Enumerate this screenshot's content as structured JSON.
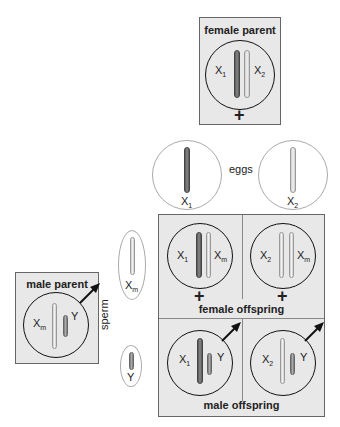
{
  "female_parent": {
    "title": "female parent",
    "chromosomes": [
      {
        "label": "X",
        "sub": "1"
      },
      {
        "label": "X",
        "sub": "2"
      }
    ],
    "symbol": "+"
  },
  "eggs": {
    "label": "eggs",
    "items": [
      {
        "label": "X",
        "sub": "1"
      },
      {
        "label": "X",
        "sub": "2"
      }
    ]
  },
  "male_parent": {
    "title": "male parent",
    "chromosomes": [
      {
        "label": "X",
        "sub": "m"
      },
      {
        "label": "Y",
        "sub": ""
      }
    ]
  },
  "sperm": {
    "label": "sperm",
    "items": [
      {
        "label": "X",
        "sub": "m"
      },
      {
        "label": "Y",
        "sub": ""
      }
    ]
  },
  "punnett": {
    "female_offspring_label": "female offspring",
    "male_offspring_label": "male offspring",
    "female": [
      {
        "a": "X",
        "as": "1",
        "b": "X",
        "bs": "m"
      },
      {
        "a": "X",
        "as": "2",
        "b": "X",
        "bs": "m"
      }
    ],
    "male": [
      {
        "a": "X",
        "as": "1",
        "b": "Y",
        "bs": ""
      },
      {
        "a": "X",
        "as": "2",
        "b": "Y",
        "bs": ""
      }
    ],
    "symbol": "+"
  }
}
